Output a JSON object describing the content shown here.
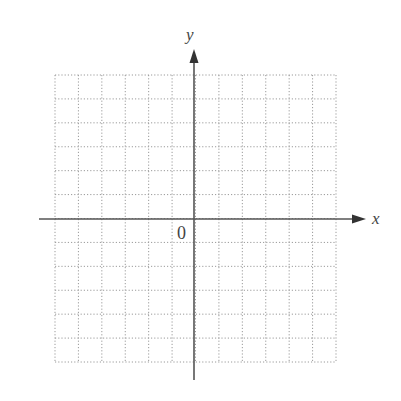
{
  "diagram": {
    "type": "coordinate-grid",
    "x_axis_label": "x",
    "y_axis_label": "y",
    "origin_label": "0",
    "grid": {
      "columns": 12,
      "rows": 12,
      "style": "dotted"
    },
    "colors": {
      "axis": "#555555",
      "grid": "#9a9a9a",
      "text": "#444444"
    }
  }
}
